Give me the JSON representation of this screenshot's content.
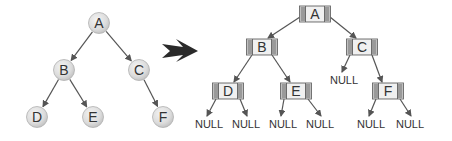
{
  "left_tree": {
    "nodes": [
      {
        "id": "A",
        "label": "A",
        "x": 99,
        "y": 23
      },
      {
        "id": "B",
        "label": "B",
        "x": 64,
        "y": 70
      },
      {
        "id": "C",
        "label": "C",
        "x": 139,
        "y": 70
      },
      {
        "id": "D",
        "label": "D",
        "x": 37,
        "y": 117
      },
      {
        "id": "E",
        "label": "E",
        "x": 93,
        "y": 117
      },
      {
        "id": "F",
        "label": "F",
        "x": 163,
        "y": 117
      }
    ],
    "edges": [
      [
        "A",
        "B"
      ],
      [
        "A",
        "C"
      ],
      [
        "B",
        "D"
      ],
      [
        "B",
        "E"
      ],
      [
        "C",
        "F"
      ]
    ]
  },
  "transform_arrow": {
    "direction": "right",
    "color": "#2a2a2a"
  },
  "right_tree": {
    "nodes": [
      {
        "id": "A",
        "label": "A",
        "x": 315,
        "y": 14
      },
      {
        "id": "B",
        "label": "B",
        "x": 262,
        "y": 47
      },
      {
        "id": "C",
        "label": "C",
        "x": 362,
        "y": 47
      },
      {
        "id": "D",
        "label": "D",
        "x": 228,
        "y": 91
      },
      {
        "id": "E",
        "label": "E",
        "x": 296,
        "y": 91
      },
      {
        "id": "F",
        "label": "F",
        "x": 388,
        "y": 91
      }
    ],
    "null_label": "NULL",
    "nulls": [
      {
        "parent": "C",
        "side": "left",
        "x": 344,
        "y": 84
      },
      {
        "parent": "D",
        "side": "left",
        "x": 209,
        "y": 128
      },
      {
        "parent": "D",
        "side": "right",
        "x": 246,
        "y": 128
      },
      {
        "parent": "E",
        "side": "left",
        "x": 283,
        "y": 128
      },
      {
        "parent": "E",
        "side": "right",
        "x": 320,
        "y": 128
      },
      {
        "parent": "F",
        "side": "left",
        "x": 371,
        "y": 128
      },
      {
        "parent": "F",
        "side": "right",
        "x": 410,
        "y": 128
      }
    ],
    "edges": [
      [
        "A",
        "B"
      ],
      [
        "A",
        "C"
      ],
      [
        "B",
        "D"
      ],
      [
        "B",
        "E"
      ],
      [
        "C",
        "F"
      ]
    ]
  },
  "colors": {
    "node_fill": "#e2e2e2",
    "node_stroke": "#b0b0b0",
    "edge": "#555555",
    "text": "#333333",
    "box_side": "#8a8a8a"
  }
}
